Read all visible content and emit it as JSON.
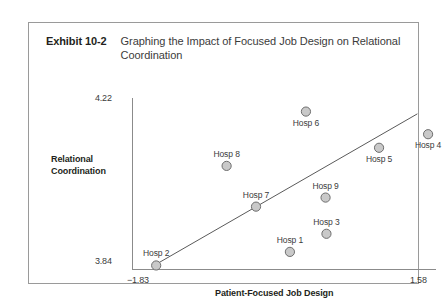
{
  "exhibit": {
    "number": "Exhibit 10-2",
    "title": "Graphing the Impact of Focused Job Design on Relational Coordination"
  },
  "axes": {
    "y_title": "Relational Coordination",
    "y_title_line1": "Relational",
    "y_title_line2": "Coordination",
    "y_tick_max": "4.22",
    "y_tick_min": "3.84",
    "x_title": "Patient-Focused Job Design",
    "x_tick_min": "−1.83",
    "x_tick_max": "1.58"
  },
  "labels": {
    "hosp1": "Hosp 1",
    "hosp2": "Hosp 2",
    "hosp3": "Hosp 3",
    "hosp4": "Hosp 4",
    "hosp5": "Hosp 5",
    "hosp6": "Hosp 6",
    "hosp7": "Hosp 7",
    "hosp8": "Hosp 8",
    "hosp9": "Hosp 9"
  },
  "colors": {
    "marker_fill": "#c9c9c9",
    "marker_stroke": "#6e6e6e",
    "axis": "#8b8b8b",
    "frame": "#9a9a9a",
    "text": "#3b3b3b",
    "trend_line": "#5a5a5a"
  },
  "chart_data": {
    "type": "scatter",
    "title": "Graphing the Impact of Focused Job Design on Relational Coordination",
    "xlabel": "Patient-Focused Job Design",
    "ylabel": "Relational Coordination",
    "xlim": [
      -1.83,
      1.58
    ],
    "ylim": [
      3.84,
      4.22
    ],
    "xticks": [
      -1.83,
      1.58
    ],
    "yticks": [
      3.84,
      4.22
    ],
    "grid": false,
    "legend": "none",
    "points": [
      {
        "label": "Hosp 2",
        "x": -1.57,
        "y": 3.85,
        "label_pos": "above"
      },
      {
        "label": "Hosp 8",
        "x": -0.78,
        "y": 4.07,
        "label_pos": "above"
      },
      {
        "label": "Hosp 7",
        "x": -0.45,
        "y": 3.98,
        "label_pos": "above"
      },
      {
        "label": "Hosp 1",
        "x": -0.07,
        "y": 3.88,
        "label_pos": "above"
      },
      {
        "label": "Hosp 6",
        "x": 0.11,
        "y": 4.19,
        "label_pos": "below"
      },
      {
        "label": "Hosp 9",
        "x": 0.33,
        "y": 4.0,
        "label_pos": "above"
      },
      {
        "label": "Hosp 3",
        "x": 0.34,
        "y": 3.92,
        "label_pos": "above"
      },
      {
        "label": "Hosp 5",
        "x": 0.93,
        "y": 4.11,
        "label_pos": "below"
      },
      {
        "label": "Hosp 4",
        "x": 1.48,
        "y": 4.14,
        "label_pos": "below"
      }
    ],
    "trend_line": {
      "type": "linear_fit",
      "x_start": -1.55,
      "y_start": 3.855,
      "x_end": 1.36,
      "y_end": 4.185
    }
  }
}
